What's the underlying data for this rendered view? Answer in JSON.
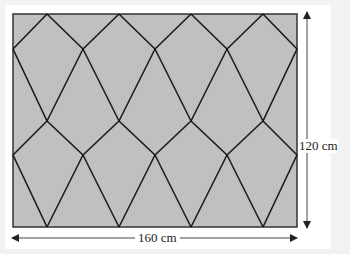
{
  "diagram": {
    "shape": "rectangle tiled with kite shapes",
    "fill_color": "#c0c0c0",
    "line_color": "#1a1a1a",
    "width_label": "160 cm",
    "height_label": "120 cm",
    "rect": {
      "x": 13,
      "y": 14,
      "w": 284,
      "h": 213
    },
    "vertices": {
      "rows_y": [
        14,
        49,
        121,
        155,
        227
      ],
      "outer_x": [
        13,
        83,
        155,
        227,
        297
      ],
      "inner_x": [
        47,
        119,
        191,
        263
      ]
    }
  }
}
